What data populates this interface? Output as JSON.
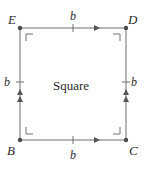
{
  "diagram": {
    "type": "square",
    "center_label": "Square",
    "colors": {
      "line": "#6e6e6e",
      "vertex": "#4a4a4a",
      "text": "#2a2a2a"
    },
    "vertices": [
      {
        "name": "E",
        "position": "top-left"
      },
      {
        "name": "D",
        "position": "top-right"
      },
      {
        "name": "B",
        "position": "bottom-left"
      },
      {
        "name": "C",
        "position": "bottom-right"
      }
    ],
    "sides": [
      {
        "from": "E",
        "to": "D",
        "label": "b",
        "arrows": 1,
        "tick": true
      },
      {
        "from": "B",
        "to": "C",
        "label": "b",
        "arrows": 1,
        "tick": true
      },
      {
        "from": "B",
        "to": "E",
        "label": "b",
        "arrows": 2,
        "tick": true
      },
      {
        "from": "C",
        "to": "D",
        "label": "b",
        "arrows": 2,
        "tick": true
      }
    ],
    "right_angle_markers": 4
  },
  "labels": {
    "E": "E",
    "D": "D",
    "B": "B",
    "C": "C",
    "top": "b",
    "bottom": "b",
    "left": "b",
    "right": "b",
    "center": "Square"
  }
}
